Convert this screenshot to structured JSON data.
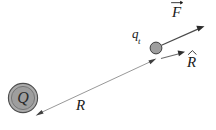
{
  "figure": {
    "background_color": "#ffffff",
    "width": 216,
    "height": 130,
    "labels": {
      "force_vector": "F",
      "force_vector_full": "F⃗",
      "unit_vector": "R",
      "unit_vector_full": "R̂",
      "separation": "R",
      "test_charge": "q",
      "test_charge_subscript": "t",
      "test_charge_full": "q_t",
      "source_charge": "Q"
    },
    "colors": {
      "source_charge_fill": "#a8a8a8",
      "source_charge_inner_fill": "#9a9a9a",
      "source_charge_stroke": "#4d4d4d",
      "test_charge_fill": "#9e9e9e",
      "test_charge_stroke": "#3f3f3f",
      "separation_line": "#8c8c8c",
      "force_line": "#4a4a4a",
      "unit_vector_line": "#6b6b6b",
      "text": "#1a1a1a"
    },
    "elements": {
      "source_charge": {
        "name": "Q",
        "center_x": 23,
        "center_y": 98,
        "outer_radius": 15,
        "inner_radius": 12
      },
      "test_charge": {
        "name": "q_t",
        "center_x": 156,
        "center_y": 48,
        "radius": 6
      },
      "separation_arrow": {
        "from_x": 37,
        "from_y": 115,
        "to_x": 154,
        "to_y": 60,
        "double_headed": true
      },
      "force_arrow": {
        "from_x": 160,
        "from_y": 45,
        "to_x": 204,
        "to_y": 26
      },
      "unit_vector_arrow": {
        "from_x": 162,
        "from_y": 58,
        "to_x": 184,
        "to_y": 52
      }
    }
  }
}
